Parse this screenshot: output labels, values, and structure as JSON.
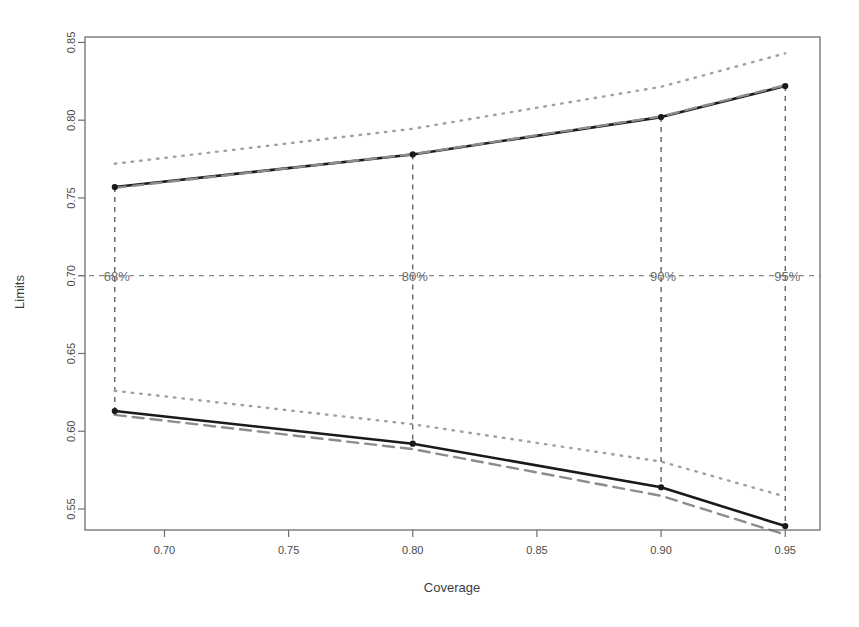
{
  "figure": {
    "background": "#ffffff",
    "frame_color": "#6e6e6e",
    "width": 859,
    "height": 627
  },
  "chart_data": {
    "type": "line",
    "title": "",
    "xlabel": "Coverage",
    "ylabel": "Limits",
    "xlim": [
      0.668,
      0.964
    ],
    "ylim": [
      0.5365,
      0.8535
    ],
    "xticks": [
      0.7,
      0.75,
      0.8,
      0.85,
      0.9,
      0.95
    ],
    "xtick_labels": [
      "0.70",
      "0.75",
      "0.80",
      "0.85",
      "0.90",
      "0.95"
    ],
    "yticks": [
      0.55,
      0.6,
      0.65,
      0.7,
      0.75,
      0.8,
      0.85
    ],
    "ytick_labels": [
      "0.55",
      "0.60",
      "0.65",
      "0.70",
      "0.75",
      "0.80",
      "0.85"
    ],
    "grid": false,
    "legend": null,
    "x": [
      0.68,
      0.8,
      0.9,
      0.95
    ],
    "series": [
      {
        "name": "upper-limit-solid",
        "style": "solid",
        "color": "#1a1a1a",
        "width": 2.6,
        "markers": true,
        "values": [
          0.757,
          0.778,
          0.802,
          0.822
        ]
      },
      {
        "name": "upper-limit-dashed",
        "style": "dashed",
        "color": "#8c8c8c",
        "width": 2.4,
        "markers": false,
        "values": [
          0.7565,
          0.7782,
          0.8024,
          0.8225
        ]
      },
      {
        "name": "upper-limit-dotted",
        "style": "dotted",
        "color": "#a0a0a0",
        "width": 2.4,
        "markers": false,
        "values": [
          0.772,
          0.7945,
          0.8215,
          0.843
        ]
      },
      {
        "name": "lower-limit-solid",
        "style": "solid",
        "color": "#1a1a1a",
        "width": 2.6,
        "markers": true,
        "values": [
          0.613,
          0.592,
          0.564,
          0.539
        ]
      },
      {
        "name": "lower-limit-dashed",
        "style": "dashed",
        "color": "#8c8c8c",
        "width": 2.4,
        "markers": false,
        "values": [
          0.6105,
          0.5885,
          0.5585,
          0.5335
        ]
      },
      {
        "name": "lower-limit-dotted",
        "style": "dotted",
        "color": "#a0a0a0",
        "width": 2.4,
        "markers": false,
        "values": [
          0.626,
          0.6045,
          0.5805,
          0.558
        ]
      }
    ],
    "annotations": [
      {
        "label": "68%",
        "x": 0.68,
        "y": 0.7
      },
      {
        "label": "80%",
        "x": 0.8,
        "y": 0.7
      },
      {
        "label": "90%",
        "x": 0.9,
        "y": 0.7
      },
      {
        "label": "95%",
        "x": 0.95,
        "y": 0.7
      }
    ],
    "reference_line": {
      "orientation": "horizontal",
      "y": 0.7,
      "style": "dashed",
      "color": "#8a8a8a"
    },
    "vertical_guides": {
      "style": "dashed",
      "color": "#4a4a4a",
      "x": [
        0.68,
        0.8,
        0.9,
        0.95
      ]
    }
  }
}
